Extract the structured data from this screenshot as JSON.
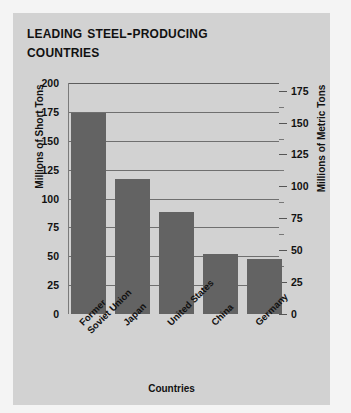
{
  "figure": {
    "title_lines": [
      "Leading Steel-Producing",
      "Countries"
    ],
    "background_color": "#d2d2d2",
    "page_background": "#f4f4f4",
    "bar_color": "#636363",
    "gridline_color": "#6f6f6f"
  },
  "chart_data": {
    "type": "bar",
    "title": "Leading Steel-Producing Countries",
    "xlabel": "Countries",
    "ylabel": "Millions of Short Tons",
    "y2label": "Millions of Metric Tons",
    "categories": [
      "Former Soviet Union",
      "Japan",
      "United States",
      "China",
      "Germany"
    ],
    "category_lines": [
      [
        "Former",
        "Soviet Union"
      ],
      [
        "Japan"
      ],
      [
        "United States"
      ],
      [
        "China"
      ],
      [
        "Germany"
      ]
    ],
    "values": [
      174,
      117,
      88,
      52,
      48
    ],
    "value_unit": "millions of short tons",
    "ylim": [
      0,
      200
    ],
    "yticks": [
      0,
      25,
      50,
      75,
      100,
      125,
      150,
      175,
      200
    ],
    "y2lim": [
      0,
      181
    ],
    "y2ticks": [
      0,
      25,
      50,
      75,
      100,
      125,
      150,
      175
    ],
    "y2_minor_ticks": [
      12.5,
      37.5,
      62.5,
      87.5,
      112.5,
      137.5,
      162.5
    ],
    "grid": true,
    "legend": false
  }
}
